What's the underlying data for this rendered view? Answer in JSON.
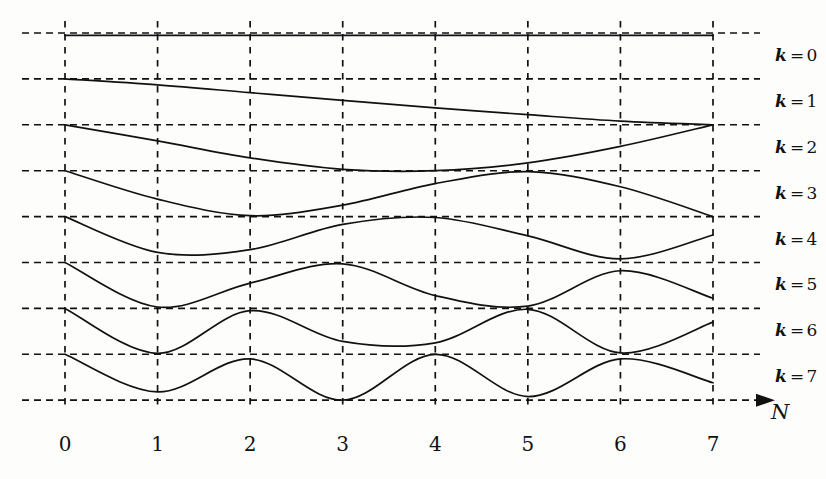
{
  "figure": {
    "background_color": "#fdfdfc",
    "ink_color": "#111111"
  },
  "chart_data": {
    "type": "line",
    "title": "",
    "subtitle": "",
    "xlabel": "N",
    "ylabel": "",
    "xlim": [
      0,
      7
    ],
    "ylim": [
      0,
      8
    ],
    "grid": true,
    "grid_style": "dashed",
    "legend_position": "right",
    "x": [
      0,
      1,
      2,
      3,
      4,
      5,
      6,
      7
    ],
    "x_tick_labels": [
      "0",
      "1",
      "2",
      "3",
      "4",
      "5",
      "6",
      "7"
    ],
    "y_gridline_count": 9,
    "annotations": [
      "Each curve k occupies the horizontal band between gridline k and gridline k+1.",
      "Curve k oscillates with approximately k half-periods across N = 0 to 7.",
      "All curves start at the top edge of their band at N = 0."
    ],
    "series": [
      {
        "name": "k = 0",
        "label": "k=0",
        "band_index": 0,
        "values": [
          0.05,
          0.05,
          0.05,
          0.05,
          0.05,
          0.05,
          0.05,
          0.05
        ],
        "description": "flat horizontal line at the top of band 0"
      },
      {
        "name": "k = 1",
        "label": "k=1",
        "band_index": 1,
        "values": [
          1.0,
          1.13,
          1.3,
          1.47,
          1.63,
          1.78,
          1.92,
          2.0
        ],
        "description": "monotonic descent from top of band to bottom of band"
      },
      {
        "name": "k = 2",
        "label": "k=2",
        "band_index": 2,
        "values": [
          2.0,
          2.35,
          2.72,
          2.97,
          3.0,
          2.83,
          2.47,
          2.0
        ],
        "description": "single broad dip reaching the bottom of the band near N = 3 to 4"
      },
      {
        "name": "k = 3",
        "label": "k=3",
        "band_index": 3,
        "values": [
          3.0,
          3.62,
          3.98,
          3.75,
          3.28,
          3.02,
          3.35,
          4.0
        ],
        "description": "dip near N = 2, rise to a peak near N = 5, then fall to bottom at N = 7"
      },
      {
        "name": "k = 4",
        "label": "k=4",
        "band_index": 4,
        "values": [
          4.0,
          4.78,
          4.72,
          4.17,
          4.02,
          4.42,
          4.92,
          4.4
        ],
        "description": "dip near N = 1.5, peak near N = 4, dip near N = 6, rising at N = 7"
      },
      {
        "name": "k = 5",
        "label": "k=5",
        "band_index": 5,
        "values": [
          5.0,
          5.97,
          5.45,
          5.03,
          5.72,
          5.95,
          5.18,
          5.78
        ],
        "description": "dip at N = 1, peak near N = 3, dip near N = 4.7, peak near N = 6"
      },
      {
        "name": "k = 6",
        "label": "k=6",
        "band_index": 6,
        "values": [
          6.0,
          6.98,
          6.05,
          6.72,
          6.75,
          6.02,
          6.97,
          6.3
        ],
        "description": "dips at N = 1 and N = 6, peaks at N = 2 and N = 5, shallow trough near N = 3.5"
      },
      {
        "name": "k = 7",
        "label": "k=7",
        "band_index": 7,
        "values": [
          7.0,
          7.82,
          7.1,
          8.0,
          7.0,
          7.92,
          7.1,
          7.62
        ],
        "description": "fastest oscillation, troughs at N = 1, 3, 5 and crests at N = 2, 4, 6"
      }
    ],
    "legend": [
      {
        "label": "k=0",
        "variable": "k",
        "value": "0"
      },
      {
        "label": "k=1",
        "variable": "k",
        "value": "1"
      },
      {
        "label": "k=2",
        "variable": "k",
        "value": "2"
      },
      {
        "label": "k=3",
        "variable": "k",
        "value": "3"
      },
      {
        "label": "k=4",
        "variable": "k",
        "value": "4"
      },
      {
        "label": "k=5",
        "variable": "k",
        "value": "5"
      },
      {
        "label": "k=6",
        "variable": "k",
        "value": "6"
      },
      {
        "label": "k=7",
        "variable": "k",
        "value": "7"
      }
    ]
  },
  "axis": {
    "x_name": "N",
    "arrow": "right-arrow-icon"
  }
}
